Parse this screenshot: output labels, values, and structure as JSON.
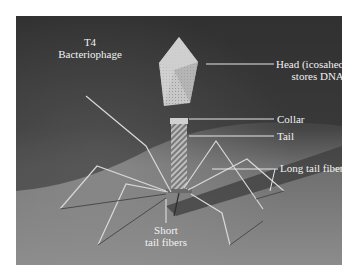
{
  "figure": {
    "title_line1": "T4",
    "title_line2": "Bacteriophage",
    "labels": {
      "head_line1": "Head (icosahedral)",
      "head_line2": "stores DNA",
      "collar": "Collar",
      "tail": "Tail",
      "long_tail_fibers": "Long tail fibers",
      "short_line1": "Short",
      "short_line2": "tail fibers"
    },
    "colors": {
      "background_top": "#3a3a3a",
      "surface": "#8a8a8a",
      "label_text": "#f2f2f2",
      "leader_line": "#e6e6e6"
    }
  }
}
